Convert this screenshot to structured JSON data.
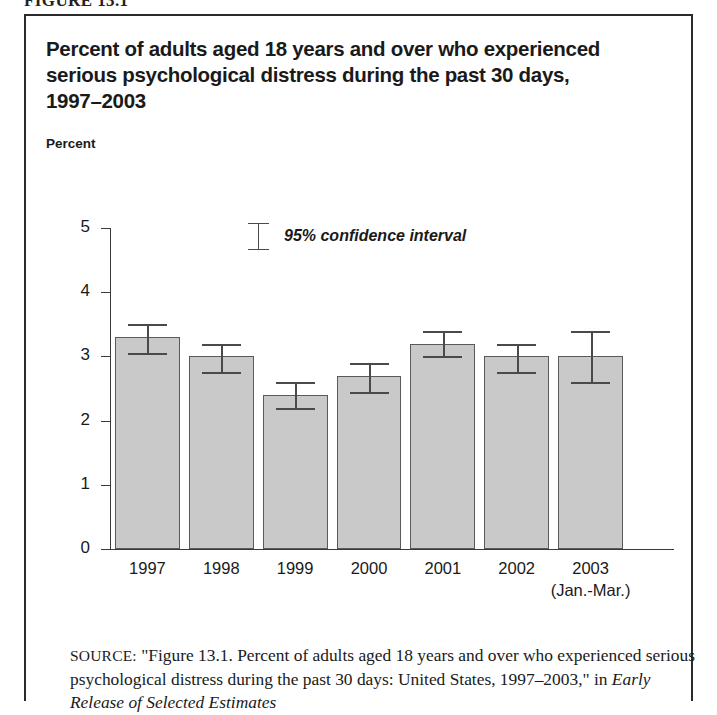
{
  "figure": {
    "number_label": "FIGURE 13.1"
  },
  "chart_title_lines": [
    "Percent of adults aged 18 years and over who experienced",
    "serious psychological distress during the past 30 days,",
    "1997–2003"
  ],
  "axis_unit_label": "Percent",
  "legend": {
    "marker_name": "error-bar-marker",
    "label": "95% confidence interval"
  },
  "source": {
    "label": "SOURCE:",
    "text_part1": " \"Figure 13.1. Percent of adults aged 18 years and over who experienced serious psychological distress during the past 30 days: United States, 1997–2003,\" in ",
    "italic_part": "Early Release of Selected Estimates"
  },
  "chart_data": {
    "type": "bar",
    "title": "Percent of adults aged 18 years and over who experienced serious psychological distress during the past 30 days, 1997–2003",
    "xlabel": "",
    "ylabel": "Percent",
    "ylim": [
      0,
      5
    ],
    "ytick_labels": [
      "0",
      "1",
      "2",
      "3",
      "4",
      "5"
    ],
    "ytick_values": [
      0,
      1,
      2,
      3,
      4,
      5
    ],
    "grid": false,
    "legend_position": "inside-top-center",
    "categories": [
      "1997",
      "1998",
      "1999",
      "2000",
      "2001",
      "2002",
      "2003"
    ],
    "category_sublabels": [
      "",
      "",
      "",
      "",
      "",
      "",
      "(Jan.-Mar.)"
    ],
    "values": [
      3.3,
      3.0,
      2.4,
      2.7,
      3.2,
      3.0,
      3.0
    ],
    "error_low": [
      3.05,
      2.75,
      2.2,
      2.45,
      3.0,
      2.75,
      2.6
    ],
    "error_high": [
      3.5,
      3.2,
      2.6,
      2.9,
      3.4,
      3.2,
      3.4
    ],
    "error_type": "95% confidence interval",
    "bar_color": "#c9c9c9",
    "bar_border_color": "#5a5a5a",
    "error_bar_color": "#4a4a4a",
    "axis_color": "#3a3a3a"
  }
}
